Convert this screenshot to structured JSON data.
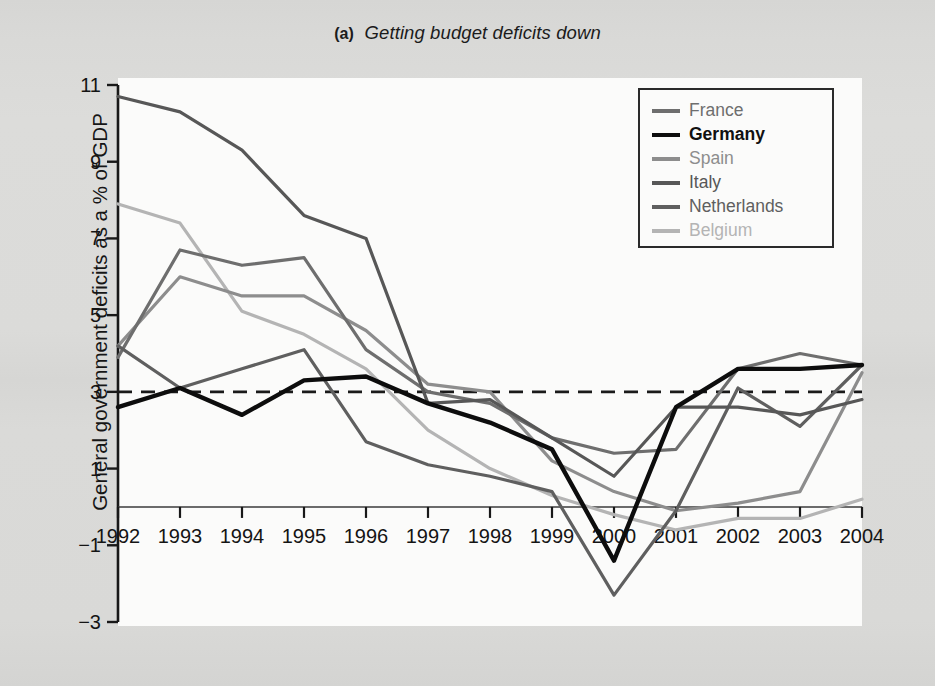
{
  "title": {
    "part_label": "(a)",
    "text": "Getting budget deficits down"
  },
  "axes": {
    "y_title": "General government deficits as a % of GDP",
    "y_ticks": [
      "11",
      "9",
      "7",
      "5",
      "3",
      "1",
      "−1",
      "−3"
    ],
    "x_ticks": [
      "1992",
      "1993",
      "1994",
      "1995",
      "1996",
      "1997",
      "1998",
      "1999",
      "2000",
      "2001",
      "2002",
      "2003",
      "2004"
    ]
  },
  "legend": {
    "items": [
      {
        "label": "France",
        "color": "#6e6e6e",
        "width": 3.2,
        "bold": false
      },
      {
        "label": "Germany",
        "color": "#0d0d0d",
        "width": 4.2,
        "bold": true
      },
      {
        "label": "Spain",
        "color": "#8d8d8d",
        "width": 3.2,
        "bold": false
      },
      {
        "label": "Italy",
        "color": "#575757",
        "width": 3.2,
        "bold": false
      },
      {
        "label": "Netherlands",
        "color": "#5f5f5f",
        "width": 3.2,
        "bold": false
      },
      {
        "label": "Belgium",
        "color": "#b4b4b4",
        "width": 3.2,
        "bold": false
      }
    ]
  },
  "reference_line": {
    "value": 3,
    "style": "dashed",
    "color": "#1a1a1a"
  },
  "chart_data": {
    "type": "line",
    "xlabel": "",
    "ylabel": "General government deficits as a % of GDP",
    "x": [
      1992,
      1993,
      1994,
      1995,
      1996,
      1997,
      1998,
      1999,
      2000,
      2001,
      2002,
      2003,
      2004
    ],
    "ylim": [
      -3,
      11
    ],
    "xlim": [
      1992,
      2004
    ],
    "yticks": [
      -3,
      -1,
      1,
      3,
      5,
      7,
      9,
      11
    ],
    "grid": false,
    "legend_position": "top-right",
    "annotations": [
      {
        "type": "hline",
        "y": 3,
        "style": "dashed",
        "note": "Maastricht 3% deficit reference"
      }
    ],
    "series": [
      {
        "name": "France",
        "color": "#6e6e6e",
        "values": [
          3.9,
          6.7,
          6.3,
          6.5,
          4.1,
          3.0,
          2.7,
          1.8,
          1.4,
          1.5,
          3.6,
          4.0,
          3.7
        ]
      },
      {
        "name": "Germany",
        "color": "#0d0d0d",
        "values": [
          2.6,
          3.1,
          2.4,
          3.3,
          3.4,
          2.7,
          2.2,
          1.5,
          -1.4,
          2.6,
          3.6,
          3.6,
          3.7
        ]
      },
      {
        "name": "Spain",
        "color": "#8d8d8d",
        "values": [
          4.2,
          6.0,
          5.5,
          5.5,
          4.6,
          3.2,
          3.0,
          1.2,
          0.4,
          -0.1,
          0.1,
          0.4,
          3.5
        ]
      },
      {
        "name": "Italy",
        "color": "#575757",
        "values": [
          10.7,
          10.3,
          9.3,
          7.6,
          7.0,
          2.7,
          2.8,
          1.8,
          0.8,
          2.6,
          2.6,
          2.4,
          2.8
        ]
      },
      {
        "name": "Netherlands",
        "color": "#5f5f5f",
        "values": [
          4.2,
          3.1,
          3.6,
          4.1,
          1.7,
          1.1,
          0.8,
          0.4,
          -2.3,
          -0.1,
          3.1,
          2.1,
          3.7
        ]
      },
      {
        "name": "Belgium",
        "color": "#b4b4b4",
        "values": [
          7.9,
          7.4,
          5.1,
          4.5,
          3.6,
          2.0,
          1.0,
          0.3,
          -0.2,
          -0.6,
          -0.3,
          -0.3,
          0.2
        ]
      }
    ]
  }
}
